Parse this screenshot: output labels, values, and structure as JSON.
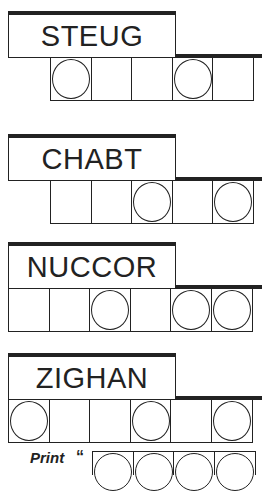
{
  "puzzles": [
    {
      "scrambled": "STEUG",
      "offset_cells": 1,
      "cells": [
        true,
        false,
        false,
        true,
        false
      ]
    },
    {
      "scrambled": "CHABT",
      "offset_cells": 1,
      "cells": [
        false,
        false,
        true,
        false,
        true
      ]
    },
    {
      "scrambled": "NUCCOR",
      "offset_cells": 0,
      "cells": [
        false,
        false,
        true,
        false,
        true,
        true
      ]
    },
    {
      "scrambled": "ZIGHAN",
      "offset_cells": 0,
      "cells": [
        true,
        false,
        false,
        true,
        false,
        true
      ]
    }
  ],
  "answer": {
    "label": "Print",
    "quote_mark": "“",
    "cell_count": 4
  },
  "colors": {
    "ink": "#222222",
    "background": "#ffffff"
  }
}
